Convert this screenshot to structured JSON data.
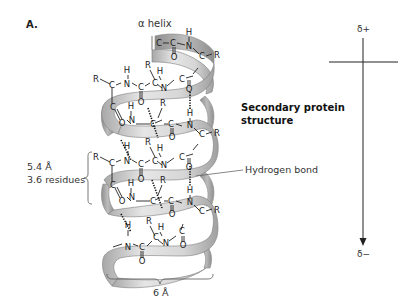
{
  "panel_label": "A.",
  "helix_title": "α helix",
  "annotations": {
    "structure_title_line1": "Secondary protein",
    "structure_title_line2": "structure",
    "hydrogen_bond": "Hydrogen bond",
    "rise_length": "5.4 Å",
    "rise_residues": "3.6 residues",
    "width": "6 Å"
  },
  "dipole": {
    "positive": "δ+",
    "negative": "δ−"
  },
  "atoms": {
    "carbon": "C",
    "nitrogen": "N",
    "oxygen": "O",
    "hydrogen": "H",
    "side_chain": "R"
  },
  "colors": {
    "ribbon_light": "#e4e4e4",
    "ribbon_mid": "#c4c4c4",
    "ribbon_dark": "#9a9a9a",
    "ink": "#222222"
  }
}
